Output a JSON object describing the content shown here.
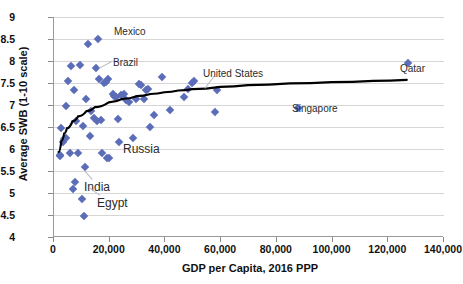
{
  "chart_data": {
    "type": "scatter",
    "title": "",
    "xlabel": "GDP per Capita, 2016 PPP",
    "ylabel": "Average SWB (1-10 scale)",
    "xlim": [
      0,
      140000
    ],
    "ylim": [
      4,
      9
    ],
    "xticks": [
      0,
      20000,
      40000,
      60000,
      80000,
      100000,
      120000,
      140000
    ],
    "xtick_labels": [
      "0",
      "20,000",
      "40,000",
      "60,000",
      "80,000",
      "100,000",
      "120,000",
      "140,000"
    ],
    "yticks": [
      4,
      4.5,
      5,
      5.5,
      6,
      6.5,
      7,
      7.5,
      8,
      8.5,
      9
    ],
    "ytick_labels": [
      "4",
      "4.5",
      "5",
      "5.5",
      "6",
      "6.5",
      "7",
      "7.5",
      "8",
      "8.5",
      "9"
    ],
    "grid": "horizontal",
    "legend": "none",
    "marker_color": "#5B6CB8",
    "marker_shape": "diamond",
    "trendline": {
      "type": "logarithmic",
      "color": "#000000",
      "points": [
        [
          2000,
          5.93
        ],
        [
          3000,
          6.18
        ],
        [
          4000,
          6.35
        ],
        [
          5000,
          6.47
        ],
        [
          7000,
          6.63
        ],
        [
          9000,
          6.74
        ],
        [
          12000,
          6.86
        ],
        [
          15000,
          6.95
        ],
        [
          20000,
          7.06
        ],
        [
          25000,
          7.14
        ],
        [
          30000,
          7.2
        ],
        [
          35000,
          7.25
        ],
        [
          40000,
          7.29
        ],
        [
          45000,
          7.33
        ],
        [
          50000,
          7.36
        ],
        [
          60000,
          7.41
        ],
        [
          70000,
          7.45
        ],
        [
          85000,
          7.49
        ],
        [
          100000,
          7.52
        ],
        [
          115000,
          7.55
        ],
        [
          127000,
          7.57
        ]
      ]
    },
    "points": [
      [
        2000,
        5.84
      ],
      [
        2300,
        5.87
      ],
      [
        2600,
        6.48
      ],
      [
        3200,
        6.16
      ],
      [
        3600,
        6.22
      ],
      [
        4200,
        6.25
      ],
      [
        4400,
        6.97
      ],
      [
        5000,
        7.55
      ],
      [
        5600,
        5.91
      ],
      [
        6200,
        7.89
      ],
      [
        6800,
        5.08
      ],
      [
        7000,
        7.33
      ],
      [
        7600,
        5.24
      ],
      [
        8000,
        6.63
      ],
      [
        8600,
        5.92
      ],
      [
        9300,
        7.92
      ],
      [
        9900,
        4.86
      ],
      [
        10400,
        6.52
      ],
      [
        10800,
        4.47
      ],
      [
        11200,
        5.58
      ],
      [
        11600,
        7.14
      ],
      [
        12200,
        8.39
      ],
      [
        12800,
        6.3
      ],
      [
        13400,
        6.87
      ],
      [
        14200,
        6.71
      ],
      [
        14900,
        7.84
      ],
      [
        15400,
        6.63
      ],
      [
        15900,
        8.5
      ],
      [
        16300,
        7.58
      ],
      [
        16900,
        6.65
      ],
      [
        17400,
        5.9
      ],
      [
        18100,
        7.5
      ],
      [
        18600,
        7.52
      ],
      [
        19000,
        5.79
      ],
      [
        19400,
        7.58
      ],
      [
        19900,
        5.8
      ],
      [
        21000,
        7.25
      ],
      [
        21600,
        7.21
      ],
      [
        22200,
        7.18
      ],
      [
        22800,
        6.68
      ],
      [
        23400,
        6.16
      ],
      [
        24200,
        7.23
      ],
      [
        25000,
        7.26
      ],
      [
        26000,
        7.11
      ],
      [
        27000,
        7.06
      ],
      [
        28200,
        6.24
      ],
      [
        29400,
        7.14
      ],
      [
        30600,
        7.48
      ],
      [
        31400,
        7.45
      ],
      [
        32200,
        7.13
      ],
      [
        32900,
        7.33
      ],
      [
        33600,
        7.37
      ],
      [
        34600,
        6.5
      ],
      [
        36000,
        6.77
      ],
      [
        38800,
        7.63
      ],
      [
        41500,
        6.89
      ],
      [
        46800,
        7.19
      ],
      [
        48200,
        7.36
      ],
      [
        49600,
        7.5
      ],
      [
        50200,
        7.54
      ],
      [
        57800,
        6.83
      ],
      [
        58600,
        7.35
      ],
      [
        87600,
        6.93
      ],
      [
        127000,
        7.95
      ]
    ],
    "annotations": [
      {
        "label": "Mexico",
        "x": 15900,
        "y": 8.5
      },
      {
        "label": "Brazil",
        "x": 14900,
        "y": 7.84
      },
      {
        "label": "United States",
        "x": 58600,
        "y": 7.35
      },
      {
        "label": "Qatar",
        "x": 127000,
        "y": 7.95
      },
      {
        "label": "Singapore",
        "x": 87600,
        "y": 6.93
      },
      {
        "label": "Russia",
        "x": 19000,
        "y": 5.79
      },
      {
        "label": "India",
        "x": 9900,
        "y": 4.86
      },
      {
        "label": "Egypt",
        "x": 10800,
        "y": 4.47
      }
    ]
  },
  "annotation_layout": [
    {
      "name": "mexico",
      "label": "Mexico",
      "left": 114,
      "top": 26,
      "size": "small",
      "leader": null
    },
    {
      "name": "brazil",
      "label": "Brazil",
      "left": 113,
      "top": 57,
      "size": "small",
      "leader": {
        "x1": 112,
        "y1": 62,
        "x2": 99,
        "y2": 69
      }
    },
    {
      "name": "united-states",
      "label": "United States",
      "left": 203,
      "top": 68,
      "size": "small",
      "leader": {
        "x1": 215,
        "y1": 76,
        "x2": 205,
        "y2": 89
      }
    },
    {
      "name": "qatar",
      "label": "Qatar",
      "left": 400,
      "top": 63,
      "size": "small",
      "leader": null
    },
    {
      "name": "singapore",
      "label": "Singapore",
      "left": 292,
      "top": 103,
      "size": "small",
      "leader": null
    },
    {
      "name": "russia",
      "label": "Russia",
      "left": 123,
      "top": 142,
      "size": "big",
      "leader": null
    },
    {
      "name": "india",
      "label": "India",
      "left": 84,
      "top": 180,
      "size": "big",
      "leader": {
        "x1": 92,
        "y1": 180,
        "x2": 85,
        "y2": 172
      }
    },
    {
      "name": "egypt",
      "label": "Egypt",
      "left": 97,
      "top": 196,
      "size": "big",
      "leader": {
        "x1": 100,
        "y1": 196,
        "x2": 89,
        "y2": 188
      }
    }
  ]
}
